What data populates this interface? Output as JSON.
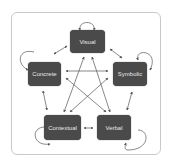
{
  "diagram": {
    "nodes": [
      {
        "id": "visual",
        "label": "Visual"
      },
      {
        "id": "concrete",
        "label": "Concrete"
      },
      {
        "id": "symbolic",
        "label": "Symbolic"
      },
      {
        "id": "contextual",
        "label": "Contextual"
      },
      {
        "id": "verbal",
        "label": "Verbal"
      }
    ],
    "edges": [
      {
        "from": "visual",
        "to": "visual",
        "type": "self-loop"
      },
      {
        "from": "concrete",
        "to": "concrete",
        "type": "self-loop"
      },
      {
        "from": "symbolic",
        "to": "symbolic",
        "type": "self-loop"
      },
      {
        "from": "contextual",
        "to": "contextual",
        "type": "self-loop"
      },
      {
        "from": "verbal",
        "to": "verbal",
        "type": "self-loop"
      },
      {
        "from": "visual",
        "to": "concrete",
        "type": "bidirectional"
      },
      {
        "from": "visual",
        "to": "symbolic",
        "type": "bidirectional"
      },
      {
        "from": "visual",
        "to": "contextual",
        "type": "bidirectional"
      },
      {
        "from": "visual",
        "to": "verbal",
        "type": "bidirectional"
      },
      {
        "from": "concrete",
        "to": "symbolic",
        "type": "bidirectional"
      },
      {
        "from": "concrete",
        "to": "contextual",
        "type": "bidirectional"
      },
      {
        "from": "concrete",
        "to": "verbal",
        "type": "bidirectional"
      },
      {
        "from": "symbolic",
        "to": "contextual",
        "type": "bidirectional"
      },
      {
        "from": "symbolic",
        "to": "verbal",
        "type": "bidirectional"
      },
      {
        "from": "contextual",
        "to": "verbal",
        "type": "bidirectional"
      }
    ],
    "colors": {
      "node_fill": "#4a4a4a",
      "node_text": "#e8e8e8",
      "edge": "#555555",
      "frame_border": "#c9c9c9"
    }
  }
}
